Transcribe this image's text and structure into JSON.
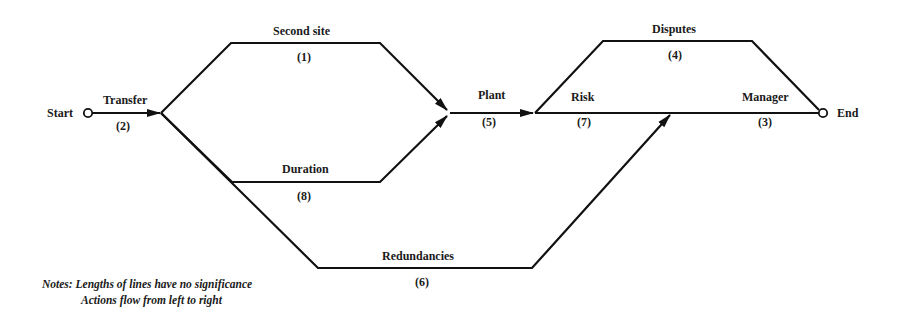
{
  "diagram": {
    "title": "",
    "terminals": {
      "start": "Start",
      "end": "End"
    },
    "activities": [
      {
        "id": "transfer",
        "label": "Transfer",
        "number": "(2)"
      },
      {
        "id": "second-site",
        "label": "Second site",
        "number": "(1)"
      },
      {
        "id": "duration",
        "label": "Duration",
        "number": "(8)"
      },
      {
        "id": "redundancies",
        "label": "Redundancies",
        "number": "(6)"
      },
      {
        "id": "plant",
        "label": "Plant",
        "number": "(5)"
      },
      {
        "id": "disputes",
        "label": "Disputes",
        "number": "(4)"
      },
      {
        "id": "risk",
        "label": "Risk",
        "number": "(7)"
      },
      {
        "id": "manager",
        "label": "Manager",
        "number": "(3)"
      }
    ],
    "notes": {
      "line1": "Notes: Lengths of lines have no significance",
      "line2": "Actions flow from left to right"
    }
  },
  "colors": {
    "line": "#111111",
    "text": "#1a1a1a",
    "background": "#ffffff"
  }
}
